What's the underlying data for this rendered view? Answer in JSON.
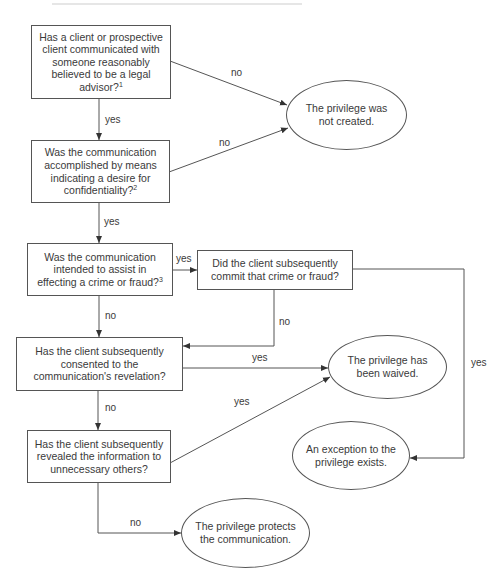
{
  "diagram": {
    "type": "flowchart",
    "title_fragment": "",
    "nodes": {
      "q1": {
        "text": "Has a client or prospective client communicated with someone reasonably believed to be a legal advisor?",
        "footnote": "1"
      },
      "q2": {
        "text": "Was the communication accomplished by means indicating a desire for confidentiality?",
        "footnote": "2"
      },
      "q3": {
        "text": "Was the communication intended to assist in effecting a crime or fraud?",
        "footnote": "3"
      },
      "q4": {
        "text": "Did the client subsequently commit that crime or fraud?",
        "footnote": ""
      },
      "q5": {
        "text": "Has the client subsequently consented to the communication's revelation?",
        "footnote": ""
      },
      "q6": {
        "text": "Has the client subsequently revealed the information to unnecessary others?",
        "footnote": ""
      },
      "o1": {
        "text": "The privilege was not created."
      },
      "o2": {
        "text": "The privilege has been waived."
      },
      "o3": {
        "text": "An exception to the privilege exists."
      },
      "o4": {
        "text": "The privilege protects the communication."
      }
    },
    "edges": [
      {
        "from": "q1",
        "to": "o1",
        "label": "no"
      },
      {
        "from": "q1",
        "to": "q2",
        "label": "yes"
      },
      {
        "from": "q2",
        "to": "o1",
        "label": "no"
      },
      {
        "from": "q2",
        "to": "q3",
        "label": "yes"
      },
      {
        "from": "q3",
        "to": "q4",
        "label": "yes"
      },
      {
        "from": "q3",
        "to": "q5",
        "label": "no"
      },
      {
        "from": "q4",
        "to": "q5",
        "label": "no"
      },
      {
        "from": "q4",
        "to": "o3",
        "label": "yes"
      },
      {
        "from": "q5",
        "to": "o2",
        "label": "yes"
      },
      {
        "from": "q5",
        "to": "q6",
        "label": "no"
      },
      {
        "from": "q6",
        "to": "o2",
        "label": "yes"
      },
      {
        "from": "q6",
        "to": "o4",
        "label": "no"
      }
    ],
    "colors": {
      "line": "#555555",
      "text": "#3a3a3a",
      "background": "#ffffff"
    }
  }
}
